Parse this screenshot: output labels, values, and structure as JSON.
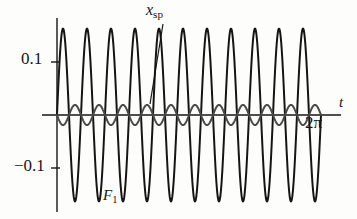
{
  "figure": {
    "background_color": "#fdfdfc"
  },
  "axes": {
    "y_tick_positive": "0.1",
    "y_tick_negative": "−0.1",
    "x_tick_label": "2π",
    "x_axis_label": "t",
    "axis_color": "#151515"
  },
  "labels": {
    "curve_large": {
      "symbol": "F",
      "subscript": "1"
    },
    "curve_small": {
      "symbol": "x",
      "subscript": "sp"
    }
  },
  "chart_data": {
    "type": "line",
    "title": "",
    "xlabel": "t",
    "ylabel": "",
    "xlim": [
      0,
      6.2832
    ],
    "ylim": [
      -0.175,
      0.175
    ],
    "xticks": [
      6.2832
    ],
    "xticklabels": [
      "2π"
    ],
    "yticks": [
      0.1,
      -0.1
    ],
    "yticklabels": [
      "0.1",
      "−0.1"
    ],
    "grid": false,
    "legend": "annotated-inline",
    "annotations": [
      {
        "text": "F₁",
        "x": 1.6,
        "y": -0.17,
        "target_series": "F_1"
      },
      {
        "text": "x_sp",
        "x": 3.05,
        "y": 0.175,
        "target_series": "x_sp",
        "leader_line": true
      }
    ],
    "series": [
      {
        "name": "F_1",
        "color": "#151515",
        "line_width": 2.0,
        "form": "sine",
        "amplitude": 0.163,
        "frequency_cycles_per_2pi": 11,
        "phase_deg": 0,
        "description": "Large-amplitude oscillation, 11 cycles over 0 to 2π, peaks ≈ +0.163, troughs ≈ -0.163"
      },
      {
        "name": "x_sp",
        "color": "#4a4a4a",
        "line_width": 2.0,
        "form": "sine",
        "amplitude": 0.019,
        "frequency_cycles_per_2pi": 11,
        "phase_deg": 180,
        "description": "Small-amplitude oscillation about the t-axis, antiphase with F_1, peaks ≈ ±0.019"
      }
    ]
  }
}
